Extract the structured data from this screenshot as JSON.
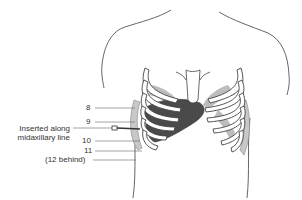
{
  "diagram": {
    "labels": {
      "rib8": "8",
      "rib9": "9",
      "rib10": "10",
      "rib11": "11",
      "rib12": "(12 behind)",
      "insert_line1": "Inserted along",
      "insert_line2": "midaxillary line"
    },
    "colors": {
      "outline": "#555555",
      "rib_fill": "#ffffff",
      "liver": "#4a4a4a",
      "lung_shade": "#b8b8b8",
      "text": "#333333"
    }
  }
}
